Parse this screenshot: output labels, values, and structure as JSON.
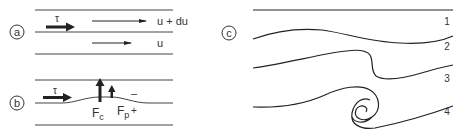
{
  "panels": {
    "a": {
      "label": "a",
      "tau": "τ",
      "upper_velocity": "u + du",
      "lower_velocity": "u"
    },
    "b": {
      "label": "b",
      "tau": "τ",
      "force_c": "F",
      "force_c_sub": "c",
      "force_p": "F",
      "force_p_sub": "p",
      "minus": "–",
      "plus": "+"
    },
    "c": {
      "label": "c",
      "stages": [
        "1",
        "2",
        "3",
        "4"
      ]
    }
  },
  "colors": {
    "line": "#222222",
    "text": "#333333",
    "background": "#ffffff"
  }
}
